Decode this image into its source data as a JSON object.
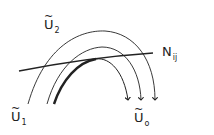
{
  "diagram": {
    "labels": {
      "u2": {
        "base": "U",
        "sub": "2",
        "tilde": "~"
      },
      "u1": {
        "base": "U",
        "sub": "1",
        "tilde": "~"
      },
      "u0": {
        "base": "U",
        "sub": "o",
        "tilde": "~"
      },
      "n": {
        "base": "N",
        "sub": "ij"
      }
    },
    "colors": {
      "stroke": "#222222",
      "background": "#ffffff"
    }
  }
}
